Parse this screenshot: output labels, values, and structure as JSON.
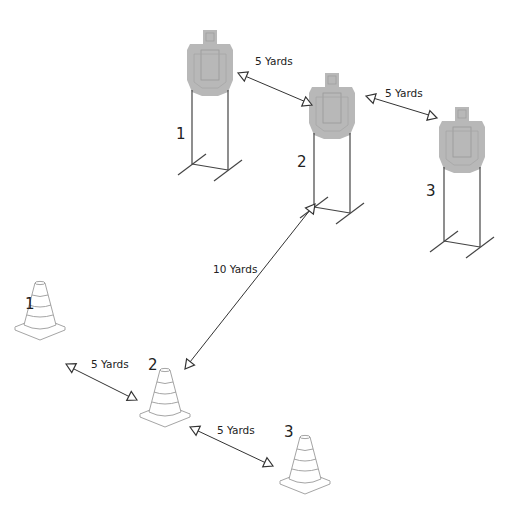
{
  "diagram": {
    "colors": {
      "target_fill": "#b8b8b8",
      "target_inner": "#a6a6a6",
      "line": "#333333",
      "cone_line": "#9a9a9a",
      "background": "#ffffff"
    },
    "targets": [
      {
        "id": "target-1",
        "label": "1",
        "x": 210,
        "y": 30
      },
      {
        "id": "target-2",
        "label": "2",
        "x": 332,
        "y": 73
      },
      {
        "id": "target-3",
        "label": "3",
        "x": 462,
        "y": 107
      }
    ],
    "cones": [
      {
        "id": "cone-1",
        "label": "1",
        "x": 40,
        "y": 300
      },
      {
        "id": "cone-2",
        "label": "2",
        "x": 165,
        "y": 370
      },
      {
        "id": "cone-3",
        "label": "3",
        "x": 305,
        "y": 438
      }
    ],
    "distances": [
      {
        "id": "t1-t2",
        "label": "5 Yards"
      },
      {
        "id": "t2-t3",
        "label": "5 Yards"
      },
      {
        "id": "c2-t2",
        "label": "10 Yards"
      },
      {
        "id": "c1-c2",
        "label": "5 Yards"
      },
      {
        "id": "c2-c3",
        "label": "5 Yards"
      }
    ]
  }
}
